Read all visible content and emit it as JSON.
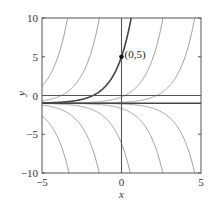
{
  "chart_data": {
    "type": "line",
    "title": "",
    "xlabel": "x",
    "ylabel": "y",
    "xlim": [
      -5,
      5
    ],
    "ylim": [
      -10,
      10
    ],
    "xticks": [
      -5,
      0,
      5
    ],
    "yticks": [
      -10,
      -5,
      0,
      5,
      10
    ],
    "xtick_labels": [
      "−5",
      "0",
      "5"
    ],
    "ytick_labels": [
      "−10",
      "−5",
      "0",
      "5",
      "10"
    ],
    "grid": false,
    "equilibrium_y": -1,
    "family_C": [
      327,
      44.3,
      0.81,
      0.11,
      -0.09,
      -0.67,
      -5.2,
      -36.5,
      -244
    ],
    "highlight": {
      "C": 6,
      "point": [
        0,
        5
      ],
      "label": "(0,5)"
    },
    "colors": {
      "family": "#9a9a9a",
      "highlight": "#444444",
      "axes": "#555555"
    }
  }
}
